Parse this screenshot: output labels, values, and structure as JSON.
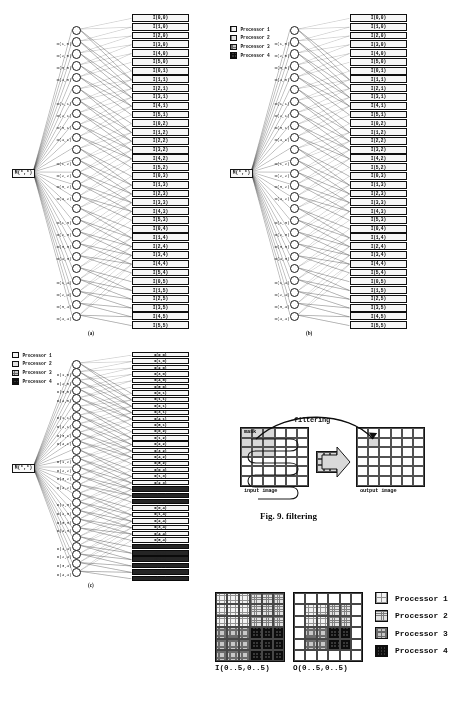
{
  "figure": {
    "page_caption": "Fig. 9. filtering",
    "subcaptions": {
      "a": "(a)",
      "b": "(b)",
      "c": "(c)"
    }
  },
  "legend": {
    "items": [
      {
        "label": "Processor 1",
        "key": "p1"
      },
      {
        "label": "Processor 2",
        "key": "p2"
      },
      {
        "label": "Processor 3",
        "key": "p3"
      },
      {
        "label": "Processor 4",
        "key": "p4"
      }
    ]
  },
  "network": {
    "source_label": "M(*,*)",
    "o_nodes": [
      "O(0,0)",
      "O(1,0)",
      "O(2,0)",
      "O(3,0)",
      "O(4,0)",
      "O(0,1)",
      "O(1,1)",
      "O(2,1)",
      "O(3,1)",
      "O(4,1)",
      "O(0,2)",
      "O(1,2)",
      "O(2,2)",
      "O(3,2)",
      "O(4,2)",
      "O(0,3)",
      "O(1,3)",
      "O(2,3)",
      "O(3,3)",
      "O(4,3)",
      "O(0,4)",
      "O(1,4)",
      "O(2,4)",
      "O(3,4)",
      "O(4,4)"
    ],
    "o_visible_labels": [
      "O(1,0)",
      "O(2,0)",
      "O(3,0)",
      "O(4,0)",
      "O(1,1)",
      "O(2,1)",
      "O(3,1)",
      "O(4,1)",
      "O(1,2)",
      "O(2,2)",
      "O(3,2)",
      "O(4,2)",
      "O(1,3)",
      "O(2,3)",
      "O(3,3)",
      "O(4,3)",
      "O(4,4)"
    ],
    "i_nodes": [
      "I(0,0)",
      "I(1,0)",
      "I(2,0)",
      "I(3,0)",
      "I(4,0)",
      "I(5,0)",
      "I(0,1)",
      "I(1,1)",
      "I(2,1)",
      "I(3,1)",
      "I(4,1)",
      "I(5,1)",
      "I(0,2)",
      "I(1,2)",
      "I(2,2)",
      "I(3,2)",
      "I(4,2)",
      "I(5,2)",
      "I(0,3)",
      "I(1,3)",
      "I(2,3)",
      "I(3,3)",
      "I(4,3)",
      "I(5,3)",
      "I(0,4)",
      "I(1,4)",
      "I(2,4)",
      "I(3,4)",
      "I(4,4)",
      "I(5,4)",
      "I(0,5)",
      "I(1,5)",
      "I(2,5)",
      "I(3,5)",
      "I(4,5)",
      "I(5,5)"
    ]
  },
  "panel_c": {
    "highlighted_processor": "p4",
    "highlighted_indices": [
      21,
      22,
      23,
      30,
      31,
      32,
      33,
      34,
      35
    ]
  },
  "fig9": {
    "title": "filtering",
    "mask_label": "mask",
    "input_label": "input image",
    "output_label": "output image",
    "input_grid": {
      "cols": 6,
      "rows": 6
    },
    "output_grid": {
      "cols": 6,
      "rows": 6
    },
    "kernel_grid": {
      "cols": 3,
      "rows": 3
    }
  },
  "bottom_grids": [
    {
      "label": "I(0..5,0..5)",
      "cols": 6,
      "rows": 6,
      "cells": [
        "p1",
        "p1",
        "p1",
        "p2",
        "p2",
        "p2",
        "p1",
        "p1",
        "p1",
        "p2",
        "p2",
        "p2",
        "p1",
        "p1",
        "p1",
        "p2",
        "p2",
        "p2",
        "p3",
        "p3",
        "p3",
        "p4",
        "p4",
        "p4",
        "p3",
        "p3",
        "p3",
        "p4",
        "p4",
        "p4",
        "p3",
        "p3",
        "p3",
        "p4",
        "p4",
        "p4"
      ]
    },
    {
      "label": "O(0..5,0..5)",
      "cols": 6,
      "rows": 6,
      "cells": [
        "none",
        "none",
        "none",
        "none",
        "none",
        "none",
        "none",
        "p1",
        "p1",
        "p2",
        "p2",
        "none",
        "none",
        "p1",
        "p1",
        "p2",
        "p2",
        "none",
        "none",
        "p3",
        "p3",
        "p4",
        "p4",
        "none",
        "none",
        "p3",
        "p3",
        "p4",
        "p4",
        "none",
        "none",
        "none",
        "none",
        "none",
        "none",
        "none"
      ]
    }
  ]
}
